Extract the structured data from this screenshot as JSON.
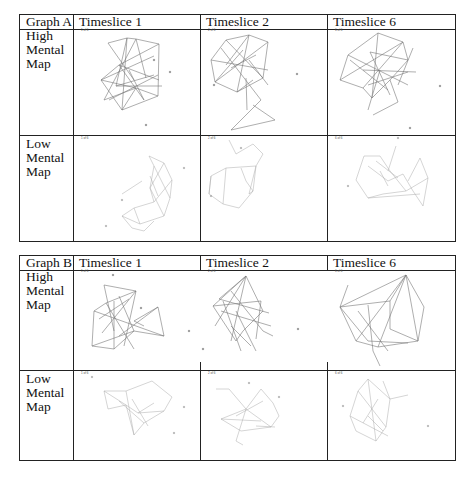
{
  "tables": [
    {
      "title": "Graph A",
      "columns": [
        "Timeslice 1",
        "Timeslice 2",
        "Timeslice 6"
      ],
      "rows": [
        {
          "label": [
            "High",
            "Mental",
            "Map"
          ]
        },
        {
          "label": [
            "Low",
            "Mental",
            "Map"
          ]
        }
      ],
      "slice_labels": [
        "1 of 6",
        "2 of 6",
        "6 of 6"
      ]
    },
    {
      "title": "Graph B",
      "columns": [
        "Timeslice 1",
        "Timeslice 2",
        "Timeslice 6"
      ],
      "rows": [
        {
          "label": [
            "High",
            "Mental",
            "Map"
          ]
        },
        {
          "label": [
            "Low",
            "Mental",
            "Map"
          ]
        }
      ],
      "slice_labels": [
        "1 of 6",
        "2 of 6",
        "6 of 6"
      ]
    }
  ],
  "colors": {
    "border": "#222222",
    "edge_high": "#777777",
    "edge_low": "#aaaaaa",
    "node": "#999999"
  }
}
